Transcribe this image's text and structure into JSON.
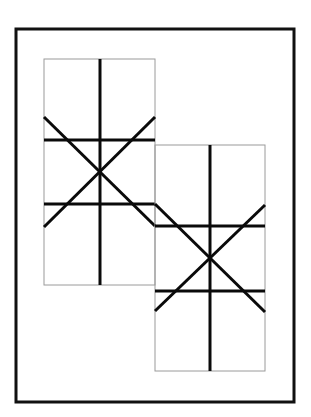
{
  "diagram": {
    "colors": {
      "background": "#ffffff",
      "frame": "#111111",
      "cell_border": "#9a9a9a",
      "stroke": "#0a0a0a"
    },
    "frame": {
      "x": 16,
      "y": 29,
      "width": 278,
      "height": 373
    },
    "panels": [
      {
        "id": "upper-left",
        "rect": {
          "x": 44,
          "y": 59,
          "width": 111,
          "height": 226
        },
        "vertical_x": 100,
        "horizontals_y": [
          140,
          204
        ],
        "center": [
          100,
          172
        ]
      },
      {
        "id": "lower-right",
        "rect": {
          "x": 155,
          "y": 145,
          "width": 110,
          "height": 226
        },
        "vertical_x": 210,
        "horizontals_y": [
          226,
          291
        ],
        "center": [
          210,
          258
        ]
      }
    ]
  }
}
